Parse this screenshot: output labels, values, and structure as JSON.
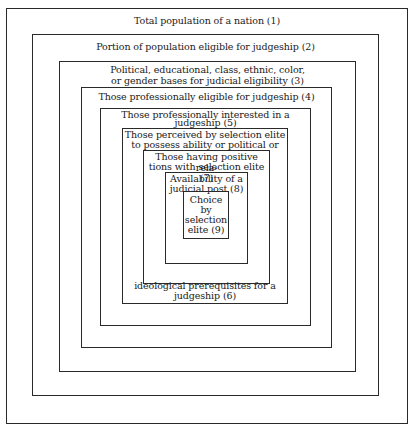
{
  "diagram": {
    "type": "nested-boxes",
    "levels": [
      {
        "id": 1,
        "label": "Total population of a nation (1)"
      },
      {
        "id": 2,
        "label": "Portion of population eligible for judgeship (2)"
      },
      {
        "id": 3,
        "label_line1": "Political, educational, class, ethnic, color,",
        "label_line2": "or gender bases for judicial eligibility (3)"
      },
      {
        "id": 4,
        "label": "Those professionally eligible for judgeship (4)"
      },
      {
        "id": 5,
        "label_line1": "Those professionally interested in a",
        "label_line2": "judgeship (5)"
      },
      {
        "id": 6,
        "label_top_line1": "Those perceived by selection elite",
        "label_top_line2": "to possess ability or political or",
        "label_bottom_line1": "ideological prerequisites for a",
        "label_bottom_line2": "judgeship (6)"
      },
      {
        "id": 7,
        "label_line1": "Those having positive rela-",
        "label_line2": "tions with selection elite (7)"
      },
      {
        "id": 8,
        "label_line1": "Availability of a",
        "label_line2": "judicial post (8)"
      },
      {
        "id": 9,
        "label_line1": "Choice",
        "label_line2": "by",
        "label_line3": "selection",
        "label_line4": "elite (9)"
      }
    ]
  }
}
